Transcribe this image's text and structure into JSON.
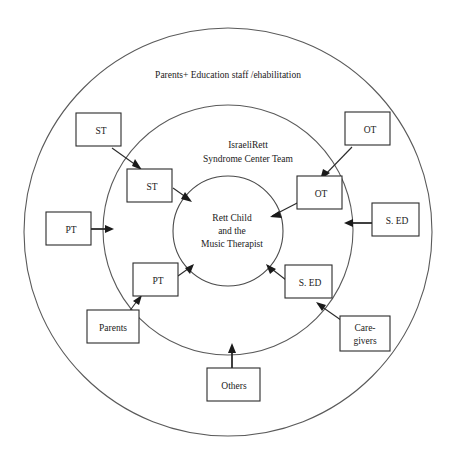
{
  "diagram": {
    "title_outer_ring": "Parents+ Education staff /ehabilitation",
    "mid_ring_label_line1": "IsraeliRett",
    "mid_ring_label_line2": "Syndrome Center Team",
    "core_label_line1": "Rett Child",
    "core_label_line2": "and the",
    "core_label_line3": "Music Therapist",
    "colors": {
      "ring_stroke": "#5a5a5a",
      "box_stroke": "#2b2b2b",
      "text": "#1a1a1a",
      "background": "#ffffff"
    },
    "outer_boxes": [
      {
        "id": "st-outer",
        "label": "ST"
      },
      {
        "id": "ot-outer",
        "label": "OT"
      },
      {
        "id": "pt-outer",
        "label": "PT"
      },
      {
        "id": "sed-outer",
        "label": "S. ED"
      },
      {
        "id": "parents-outer",
        "label": "Parents"
      },
      {
        "id": "caregivers-l1",
        "label": "Care-"
      },
      {
        "id": "caregivers-l2",
        "label": "givers"
      },
      {
        "id": "others-outer",
        "label": "Others"
      }
    ],
    "inner_boxes": [
      {
        "id": "st-inner",
        "label": "ST"
      },
      {
        "id": "ot-inner",
        "label": "OT"
      },
      {
        "id": "pt-inner",
        "label": "PT"
      },
      {
        "id": "sed-inner",
        "label": "S. ED"
      }
    ],
    "connections": [
      {
        "from": "st-outer",
        "to": "st-inner"
      },
      {
        "from": "st-inner",
        "to": "core"
      },
      {
        "from": "ot-outer",
        "to": "ot-inner"
      },
      {
        "from": "ot-inner",
        "to": "core"
      },
      {
        "from": "pt-outer",
        "to": "mid-ring"
      },
      {
        "from": "sed-outer",
        "to": "core"
      },
      {
        "from": "parents-outer",
        "to": "pt-inner"
      },
      {
        "from": "pt-inner",
        "to": "core"
      },
      {
        "from": "caregivers",
        "to": "sed-inner"
      },
      {
        "from": "sed-inner",
        "to": "core"
      },
      {
        "from": "others-outer",
        "to": "mid-ring"
      }
    ]
  }
}
